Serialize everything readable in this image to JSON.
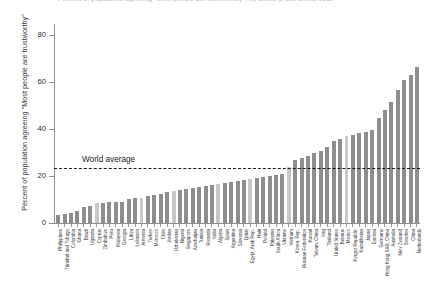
{
  "chart_data": {
    "type": "bar",
    "title": "Percent of population agreeing \"Most people are trustworthy\", by country, and world, 2012",
    "xlabel": "",
    "ylabel": "Percent of population agreeing \"Most people are trustworthy\"",
    "ylim": [
      0,
      85
    ],
    "yticks": [
      0,
      20,
      40,
      60,
      80
    ],
    "ytick_labels": [
      "0",
      "20",
      "40",
      "60",
      "80"
    ],
    "grid": false,
    "legend": null,
    "bar_color": "#8e8e8e",
    "bar_color_alt": "#c8c8c8",
    "annotations": [
      {
        "name": "world-average",
        "label": "World average",
        "value": 23.5,
        "style": "dashed-horizontal-line",
        "color": "#1a1a1a"
      }
    ],
    "categories": [
      "Philippines",
      "Trinidad and Tobago",
      "Colombia",
      "Ghana",
      "Brazil",
      "Uganda",
      "Cyprus",
      "Zimbabwe",
      "Peru",
      "Malaysia",
      "Georgia",
      "Libya",
      "Lebanon",
      "Armenia",
      "Turkey",
      "Morocco",
      "Chile",
      "Jordan",
      "Uzbekistan",
      "Nigeria",
      "Singapore",
      "Azerbaijan",
      "Tunisia",
      "Rwanda",
      "India",
      "Algeria",
      "Spain",
      "Argentina",
      "Slovenia",
      "Qatar",
      "Egypt, Arab Rep.",
      "Haiti",
      "Poland",
      "Pakistan",
      "South Africa",
      "Ukraine",
      "Vietnam",
      "Korea, Rep.",
      "Russian Federation",
      "Kuwait",
      "Taiwan, China",
      "Iraq",
      "Thailand",
      "United States",
      "Belarus",
      "Mexico",
      "Kyrgyz Republic",
      "Kazakhstan",
      "Japan",
      "Estonia",
      "Germany",
      "Hong Kong SAR, China",
      "Australia",
      "New Zealand",
      "Sweden",
      "China",
      "Netherlands"
    ],
    "values": [
      3.2,
      3.8,
      4.1,
      5.0,
      7.0,
      7.4,
      8.4,
      8.6,
      8.8,
      8.9,
      9.0,
      10.2,
      10.5,
      10.8,
      11.6,
      12.0,
      12.4,
      13.0,
      13.4,
      14.0,
      14.6,
      14.8,
      15.2,
      15.6,
      16.0,
      16.4,
      17.0,
      17.4,
      17.8,
      18.2,
      18.6,
      19.0,
      19.4,
      19.8,
      20.2,
      21.0,
      23.6,
      26.6,
      27.8,
      28.4,
      29.8,
      30.6,
      32.2,
      34.8,
      35.6,
      36.8,
      37.6,
      38.2,
      38.8,
      39.4,
      44.6,
      48.0,
      51.4,
      56.6,
      60.8,
      62.8,
      66.2
    ],
    "highlight_light_indices": [
      6,
      13,
      18,
      25,
      30,
      36,
      45
    ]
  }
}
